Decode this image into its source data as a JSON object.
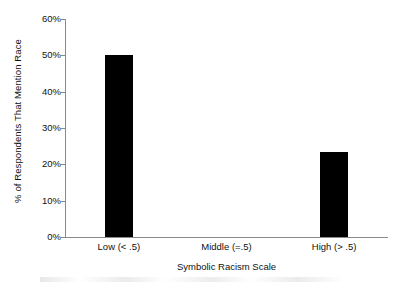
{
  "chart_data": {
    "type": "bar",
    "title": "",
    "subtitle": "",
    "xlabel": "Symbolic Racism Scale",
    "ylabel": "% of Respondents That Mention Race",
    "categories": [
      "Low (< .5)",
      "Middle (=.5)",
      "High (> .5)"
    ],
    "values": [
      50.0,
      0.0,
      23.4
    ],
    "value_labels": [
      "50%",
      "0%",
      "23.4%"
    ],
    "ylim": [
      0,
      60
    ],
    "ytick_values": [
      0,
      10,
      20,
      30,
      40,
      50,
      60
    ],
    "ytick_labels": [
      "0%",
      "10%",
      "20%",
      "30%",
      "40%",
      "50%",
      "60%"
    ],
    "grid": false,
    "legend": false,
    "legend_position": "none",
    "bar_color": "#000000",
    "axis_color": "#8a8a8a",
    "text_color": "#111111",
    "background": "#ffffff"
  }
}
